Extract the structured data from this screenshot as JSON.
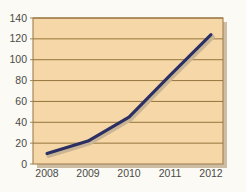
{
  "chart_data": {
    "type": "line",
    "title": "",
    "subtitle": "",
    "xlabel": "",
    "ylabel": "",
    "categories": [
      "2008",
      "2009",
      "2010",
      "2011",
      "2012"
    ],
    "x": [
      2008,
      2009,
      2010,
      2011,
      2012
    ],
    "values": [
      10,
      22,
      45,
      85,
      124
    ],
    "series": [
      {
        "name": "",
        "values": [
          10,
          22,
          45,
          85,
          124
        ]
      }
    ],
    "y_ticks": [
      0,
      20,
      40,
      60,
      80,
      100,
      120,
      140
    ],
    "y_tick_labels": [
      "0",
      "20",
      "40",
      "60",
      "80",
      "100",
      "120",
      "140"
    ],
    "x_tick_labels": [
      "2008",
      "2009",
      "2010",
      "2011",
      "2012"
    ],
    "ylim": [
      0,
      140
    ],
    "grid": "horizontal",
    "legend": "none",
    "annotations": [],
    "colors": {
      "line": "#2b2f63",
      "line_shadow": "#c9b594",
      "plot_background": "#f6d7a8",
      "plot_border": "#a8885a",
      "gridline": "#8a6a2f",
      "page_background": "#fbfaf4",
      "tick_text": "#4a4a46"
    }
  }
}
